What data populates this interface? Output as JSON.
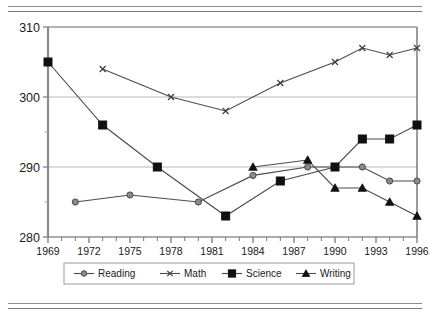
{
  "document": {
    "cropped_header_text": "",
    "rules": {
      "top": "double-rule",
      "bottom": "double-rule"
    }
  },
  "chart_data": {
    "type": "line",
    "title": "",
    "xlabel": "Year",
    "ylabel": "",
    "xlim": [
      1969,
      1996
    ],
    "ylim": [
      280,
      310
    ],
    "ytick_labels": [
      "280",
      "290",
      "300",
      "310"
    ],
    "yticks": [
      280,
      290,
      300,
      310
    ],
    "yminor_ticks": [
      285,
      295,
      305
    ],
    "xtick_labels": [
      "1969",
      "1972",
      "1975",
      "1978",
      "1981",
      "1984",
      "1987",
      "1990",
      "1993",
      "1996"
    ],
    "xticks": [
      1969,
      1972,
      1975,
      1978,
      1981,
      1984,
      1987,
      1990,
      1993,
      1996
    ],
    "grid": "horizontal-major",
    "legend_position": "bottom",
    "series": [
      {
        "name": "Reading",
        "marker": "circle",
        "color": "#6b6b6b",
        "x": [
          1971,
          1975,
          1980,
          1984,
          1988,
          1990,
          1992,
          1994,
          1996
        ],
        "y": [
          285,
          286,
          285,
          288.8,
          290,
          290,
          290,
          288,
          288
        ]
      },
      {
        "name": "Math",
        "marker": "x",
        "color": "#4a4a4a",
        "x": [
          1973,
          1978,
          1982,
          1986,
          1990,
          1992,
          1994,
          1996
        ],
        "y": [
          304,
          300,
          298,
          302,
          305,
          307,
          306,
          307
        ]
      },
      {
        "name": "Science",
        "marker": "square",
        "color": "#111111",
        "x": [
          1969,
          1973,
          1977,
          1982,
          1986,
          1990,
          1992,
          1994,
          1996
        ],
        "y": [
          305,
          296,
          290,
          283,
          288,
          290,
          294,
          294,
          296
        ]
      },
      {
        "name": "Writing",
        "marker": "triangle",
        "color": "#111111",
        "x": [
          1984,
          1988,
          1990,
          1992,
          1994,
          1996
        ],
        "y": [
          290,
          291,
          287,
          287,
          285,
          283
        ]
      }
    ]
  },
  "legend": {
    "items": [
      {
        "label": "Reading",
        "marker": "circle"
      },
      {
        "label": "Math",
        "marker": "x"
      },
      {
        "label": "Science",
        "marker": "square"
      },
      {
        "label": "Writing",
        "marker": "triangle"
      }
    ]
  }
}
